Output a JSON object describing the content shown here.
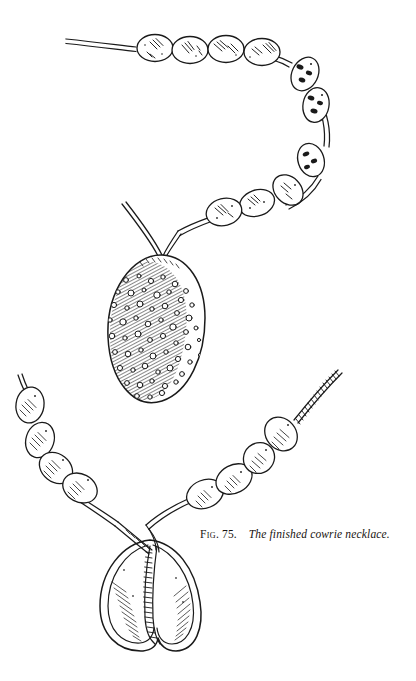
{
  "figure": {
    "caption": {
      "label": "Fig.",
      "number": "75.",
      "text": "The finished cowrie necklace."
    },
    "medium": "pen-and-ink line drawing",
    "background_color": "#ffffff",
    "ink_color": "#1a1a1a",
    "illustrations": [
      {
        "name": "upper-necklace",
        "view": "dorsal",
        "description": "Strand of oval beads on a doubled cord curving from upper left across the top and down the right, ending at a large spotted cowrie shell pendant shown from the top (dorsal) side.",
        "bead_count": 10,
        "pendant": {
          "name": "cowrie-shell-dorsal",
          "pattern": "diagonal hatching with scattered white circular spots",
          "spot_count": 58
        }
      },
      {
        "name": "lower-necklace",
        "view": "ventral",
        "description": "Lower portion of the necklace with oval beads on each side of a twisted cord, meeting at a cowrie shell pendant shown from the underside with its long toothed aperture.",
        "bead_count": 8,
        "pendant": {
          "name": "cowrie-shell-ventral",
          "feature": "toothed aperture slit",
          "tooth_count": 30
        }
      }
    ]
  }
}
